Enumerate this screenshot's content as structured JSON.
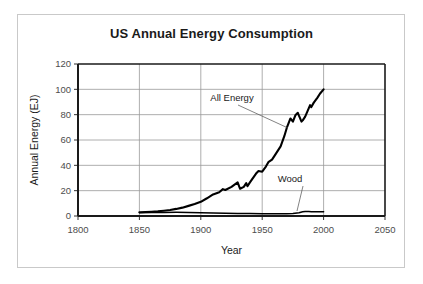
{
  "chart_data": {
    "type": "line",
    "title": "US Annual Energy Consumption",
    "xlabel": "Year",
    "ylabel": "Annual Energy (EJ)",
    "xlim": [
      1800,
      2050
    ],
    "ylim": [
      0,
      120
    ],
    "xticks": [
      1800,
      1850,
      1900,
      1950,
      2000,
      2050
    ],
    "yticks": [
      0,
      20,
      40,
      60,
      80,
      100,
      120
    ],
    "xtick_labels": [
      "1800",
      "1850",
      "1900",
      "1950",
      "2000",
      "2050"
    ],
    "ytick_labels": [
      "0",
      "20",
      "40",
      "60",
      "80",
      "100",
      "120"
    ],
    "grid": true,
    "grid_color": "#999999",
    "legend": "none",
    "series": [
      {
        "name": "All Energy",
        "color": "#000000",
        "line_width": 2.1,
        "x": [
          1850,
          1855,
          1860,
          1865,
          1870,
          1875,
          1880,
          1885,
          1890,
          1895,
          1900,
          1905,
          1910,
          1915,
          1918,
          1920,
          1925,
          1930,
          1932,
          1935,
          1937,
          1938,
          1940,
          1945,
          1947,
          1950,
          1953,
          1955,
          1958,
          1960,
          1965,
          1968,
          1970,
          1973,
          1975,
          1977,
          1979,
          1980,
          1982,
          1983,
          1985,
          1987,
          1989,
          1990,
          1992,
          1995,
          1997,
          2000
        ],
        "y": [
          3.0,
          3.2,
          3.4,
          3.7,
          4.2,
          4.8,
          5.6,
          6.6,
          8.0,
          9.5,
          11.2,
          14.0,
          17.0,
          18.8,
          21.2,
          20.5,
          23.0,
          26.5,
          21.5,
          23.0,
          26.0,
          23.5,
          26.5,
          33.5,
          35.5,
          35.0,
          39.0,
          42.5,
          44.5,
          47.5,
          55.0,
          63.0,
          69.5,
          77.0,
          74.5,
          79.5,
          81.5,
          79.0,
          74.5,
          75.5,
          78.5,
          83.0,
          87.5,
          86.0,
          89.5,
          93.5,
          96.5,
          100.0
        ]
      },
      {
        "name": "Wood",
        "color": "#000000",
        "line_width": 1.5,
        "x": [
          1850,
          1860,
          1870,
          1880,
          1890,
          1900,
          1910,
          1920,
          1930,
          1940,
          1950,
          1960,
          1970,
          1975,
          1980,
          1983,
          1985,
          1988,
          1990,
          1995,
          2000
        ],
        "y": [
          2.6,
          2.7,
          2.8,
          2.9,
          2.8,
          2.6,
          2.4,
          2.2,
          2.0,
          1.9,
          1.8,
          1.7,
          1.7,
          2.0,
          2.6,
          3.3,
          3.6,
          3.5,
          3.4,
          3.3,
          3.3
        ]
      }
    ],
    "annotations": [
      {
        "text": "All Energy",
        "label_x": 232,
        "label_y": 101,
        "leader_from_x": 238,
        "leader_from_y": 105,
        "leader_to_x": 288,
        "leader_to_y": 128
      },
      {
        "text": "Wood",
        "label_x": 290,
        "label_y": 182,
        "leader_from_x": 303,
        "leader_from_y": 186,
        "leader_to_x": 297,
        "leader_to_y": 211
      }
    ]
  },
  "axes_geometry": {
    "left": 78,
    "right": 385,
    "top": 64,
    "bottom": 216
  },
  "style": {
    "frame_color": "#c9c9c9",
    "axis_color": "#1a1a1a",
    "grid_color": "#999999",
    "tick_label_color": "#4d4d4d",
    "title_color": "#1a1a1a"
  }
}
